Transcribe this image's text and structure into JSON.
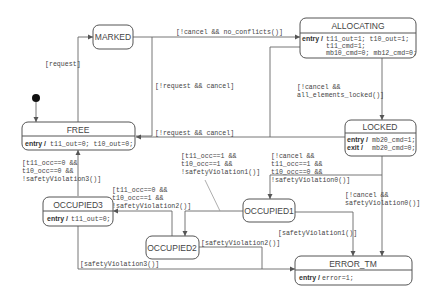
{
  "diagram": {
    "type": "state-machine",
    "initial_state": "FREE",
    "colors": {
      "stroke": "#555555",
      "text": "#444444",
      "background": "#ffffff",
      "initial_dot": "#111111"
    },
    "states": {
      "marked": {
        "name": "MARKED"
      },
      "allocating": {
        "name": "ALLOCATING",
        "entry_kw": "entry /",
        "entry_lines": [
          "t11_out=1; t10_out=1;",
          "t11_cmd=1;",
          "mb10_cmd=0; mb12_cmd=0;"
        ]
      },
      "free": {
        "name": "FREE",
        "entry_kw": "entry /",
        "entry": "t11_out=0; t10_out=0;"
      },
      "locked": {
        "name": "LOCKED",
        "entry_kw": "entry /",
        "entry": "mb20_cmd=1;",
        "exit_kw": "exit /",
        "exit": "mb20_cmd=0;"
      },
      "occupied3": {
        "name": "OCCUPIED3",
        "entry_kw": "entry /",
        "entry": "t11_out=0;"
      },
      "occupied1": {
        "name": "OCCUPIED1"
      },
      "occupied2": {
        "name": "OCCUPIED2"
      },
      "error_tm": {
        "name": "ERROR_TM",
        "entry_kw": "entry /",
        "entry": "error=1;"
      }
    },
    "transitions": {
      "free_to_marked": {
        "from": "FREE",
        "to": "MARKED",
        "guard": "[request]"
      },
      "marked_to_allocating": {
        "from": "MARKED",
        "to": "ALLOCATING",
        "guard": "[!cancel && no_conflicts()]"
      },
      "marked_to_free": {
        "from": "MARKED",
        "to": "FREE",
        "guard": "[!request && cancel]"
      },
      "allocating_to_free": {
        "from": "ALLOCATING",
        "to": "FREE",
        "guard": "[!request && cancel]"
      },
      "allocating_to_locked": {
        "from": "ALLOCATING",
        "to": "LOCKED",
        "guard_lines": [
          "[!cancel &&",
          " all_elements_locked()]"
        ]
      },
      "occupied3_to_free": {
        "from": "OCCUPIED3",
        "to": "FREE",
        "guard_lines": [
          "[t11_occ==0 &&",
          " t10_occ==0 &&",
          " !safetyViolation3()]"
        ]
      },
      "occupied1_to_occupied2": {
        "from": "OCCUPIED1",
        "to": "OCCUPIED2",
        "guard_lines": [
          "[t11_occ==1 &&",
          " t10_occ==1 &&",
          " !safetyViolation1()]"
        ]
      },
      "locked_to_occupied1": {
        "from": "LOCKED",
        "to": "OCCUPIED1",
        "guard_lines": [
          "[!cancel &&",
          " t11_occ==1 &&",
          " t10_occ==0 &&",
          " !safetyViolation0()]"
        ]
      },
      "locked_to_error": {
        "from": "LOCKED",
        "to": "ERROR_TM",
        "guard_lines": [
          "[!cancel &&",
          " safetyViolation0()]"
        ]
      },
      "occupied2_to_occupied3": {
        "from": "OCCUPIED2",
        "to": "OCCUPIED3",
        "guard_lines": [
          "[t11_occ==0 &&",
          " t10_occ==1 &&",
          " !safetyViolation2()]"
        ]
      },
      "occupied1_to_error": {
        "from": "OCCUPIED1",
        "to": "ERROR_TM",
        "guard": "[safetyViolation1()]"
      },
      "occupied2_to_error": {
        "from": "OCCUPIED2",
        "to": "ERROR_TM",
        "guard": "[safetyViolation2()]"
      },
      "occupied3_to_error": {
        "from": "OCCUPIED3",
        "to": "ERROR_TM",
        "guard": "[safetyViolation3()]"
      }
    }
  }
}
